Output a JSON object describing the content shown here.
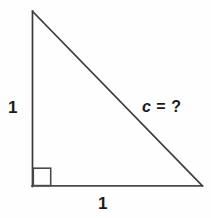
{
  "figure": {
    "background_color": "#fefefe",
    "stroke_color": "#3a3a3a",
    "text_color": "#1a1a1a"
  },
  "labels": {
    "leg_vertical": "1",
    "leg_horizontal": "1",
    "hypotenuse_var": "c",
    "hypotenuse_rest": " = ?",
    "hypotenuse_full": "c = ?"
  },
  "geometry": {
    "apex": [
      32,
      11
    ],
    "bottom_left": [
      32,
      186
    ],
    "bottom_right": [
      202,
      186
    ],
    "right_angle_marker": {
      "x": 33,
      "y": 168,
      "size": 18
    },
    "stroke_width": 1.6
  }
}
